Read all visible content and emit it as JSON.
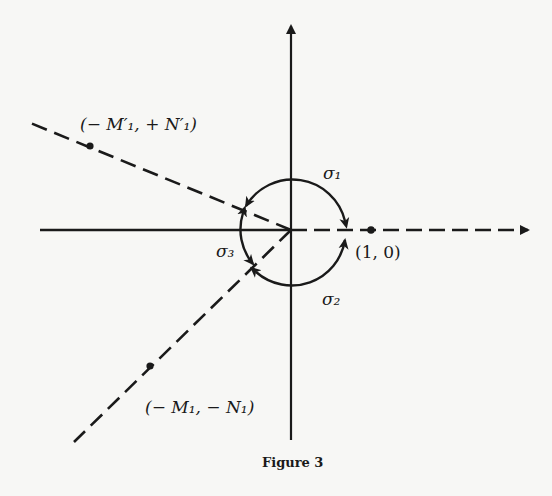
{
  "figure": {
    "caption": "Figure 3",
    "origin": [
      291,
      230
    ],
    "ink_color": "#1a1a1a",
    "background": "#f7f7f5"
  },
  "labels": {
    "point_upper": "(− M′₁, + N′₁)",
    "point_lower": "(− M₁, − N₁)",
    "point_unit": "(1, 0)",
    "sigma1": "σ₁",
    "sigma2": "σ₂",
    "sigma3": "σ₃"
  },
  "points": [
    {
      "name": "upper",
      "label": "(-M'1, +N'1)",
      "px": [
        90,
        145
      ]
    },
    {
      "name": "unit",
      "label": "(1, 0)",
      "px": [
        370,
        230
      ]
    },
    {
      "name": "lower",
      "label": "(-M1, -N1)",
      "px": [
        150,
        365
      ]
    }
  ],
  "rays": [
    {
      "name": "positive-x-axis",
      "style": "dashed",
      "arrow": true
    },
    {
      "name": "negative-x-axis",
      "style": "solid",
      "arrow": false
    },
    {
      "name": "y-axis",
      "style": "solid",
      "arrow": true
    },
    {
      "name": "ray-upper-left",
      "style": "dashed"
    },
    {
      "name": "ray-lower-left",
      "style": "dashed"
    }
  ],
  "arcs": [
    {
      "name": "sigma1",
      "from": "upper-left ray",
      "to": "positive x-axis",
      "direction": "clockwise over top"
    },
    {
      "name": "sigma2",
      "from": "lower-left ray",
      "to": "positive x-axis",
      "direction": "counterclockwise under bottom"
    },
    {
      "name": "sigma3",
      "between": "upper-left and lower-left rays",
      "arrows": "both ends"
    }
  ]
}
